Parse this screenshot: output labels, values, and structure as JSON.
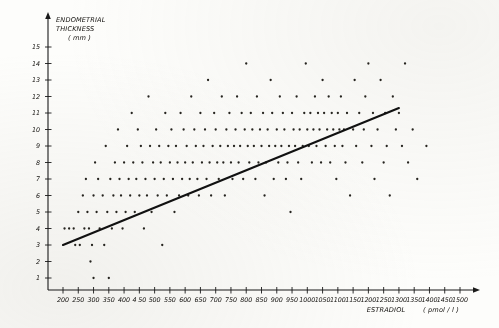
{
  "chart_data": {
    "type": "scatter",
    "title": "",
    "xlabel": "ESTRADIOL",
    "xunit": "( pmol / l )",
    "ylabel_line1": "ENDOMETRIAL",
    "ylabel_line2": "THICKNESS",
    "yunit": "( mm )",
    "xlim": [
      175,
      1520
    ],
    "ylim": [
      0.4,
      15.8
    ],
    "grid": false,
    "legend": "none",
    "xticks": [
      200,
      250,
      300,
      350,
      400,
      450,
      500,
      550,
      600,
      650,
      700,
      750,
      800,
      850,
      900,
      950,
      1000,
      1050,
      1100,
      1150,
      1200,
      1250,
      1300,
      1350,
      1400,
      1450,
      1500
    ],
    "xtick_labels": [
      "200",
      "250",
      "300",
      "350",
      "400",
      "4 50",
      "500",
      "550",
      "600",
      "650",
      "700",
      "750",
      "800",
      "850",
      "900",
      "950",
      "1000",
      "1050",
      "1100",
      "1150",
      "1200",
      "1250",
      "1300",
      "1350",
      "1400",
      "1450",
      "1500"
    ],
    "yticks": [
      1,
      2,
      3,
      4,
      5,
      6,
      7,
      8,
      9,
      10,
      11,
      12,
      13,
      14,
      15
    ],
    "ytick_labels": [
      "1",
      "2",
      "3",
      "4",
      "5",
      "6",
      "7",
      "8",
      "9",
      "10",
      "11",
      "12",
      "13",
      "14",
      "15"
    ],
    "regression_line": {
      "x_start": 200,
      "y_start": 3.0,
      "x_end": 1300,
      "y_end": 11.3,
      "slope_per_1000": 7.55,
      "intercept": 1.49
    },
    "point_color": "#26241f",
    "line_color": "#111111",
    "points": [
      [
        205,
        4
      ],
      [
        220,
        4
      ],
      [
        235,
        4
      ],
      [
        240,
        3
      ],
      [
        250,
        5
      ],
      [
        255,
        3
      ],
      [
        265,
        6
      ],
      [
        270,
        4
      ],
      [
        275,
        7
      ],
      [
        280,
        5
      ],
      [
        285,
        4
      ],
      [
        290,
        2
      ],
      [
        295,
        3
      ],
      [
        300,
        6
      ],
      [
        300,
        1
      ],
      [
        305,
        8
      ],
      [
        310,
        5
      ],
      [
        315,
        7
      ],
      [
        320,
        4
      ],
      [
        330,
        6
      ],
      [
        335,
        3
      ],
      [
        340,
        9
      ],
      [
        345,
        5
      ],
      [
        350,
        1
      ],
      [
        355,
        7
      ],
      [
        360,
        4
      ],
      [
        365,
        6
      ],
      [
        370,
        8
      ],
      [
        375,
        5
      ],
      [
        380,
        10
      ],
      [
        385,
        7
      ],
      [
        390,
        6
      ],
      [
        395,
        4
      ],
      [
        400,
        8
      ],
      [
        405,
        5
      ],
      [
        410,
        9
      ],
      [
        415,
        7
      ],
      [
        420,
        6
      ],
      [
        425,
        11
      ],
      [
        430,
        8
      ],
      [
        435,
        5
      ],
      [
        440,
        7
      ],
      [
        445,
        10
      ],
      [
        450,
        6
      ],
      [
        455,
        9
      ],
      [
        460,
        8
      ],
      [
        465,
        4
      ],
      [
        470,
        7
      ],
      [
        475,
        6
      ],
      [
        480,
        12
      ],
      [
        485,
        9
      ],
      [
        490,
        5
      ],
      [
        495,
        8
      ],
      [
        500,
        7
      ],
      [
        505,
        10
      ],
      [
        510,
        6
      ],
      [
        515,
        9
      ],
      [
        520,
        8
      ],
      [
        525,
        3
      ],
      [
        530,
        7
      ],
      [
        535,
        11
      ],
      [
        540,
        6
      ],
      [
        545,
        9
      ],
      [
        550,
        8
      ],
      [
        555,
        10
      ],
      [
        560,
        7
      ],
      [
        565,
        5
      ],
      [
        570,
        9
      ],
      [
        575,
        8
      ],
      [
        580,
        6
      ],
      [
        585,
        11
      ],
      [
        590,
        7
      ],
      [
        595,
        10
      ],
      [
        600,
        8
      ],
      [
        605,
        9
      ],
      [
        610,
        6
      ],
      [
        615,
        7
      ],
      [
        620,
        12
      ],
      [
        625,
        8
      ],
      [
        630,
        10
      ],
      [
        635,
        9
      ],
      [
        640,
        7
      ],
      [
        645,
        6
      ],
      [
        650,
        11
      ],
      [
        655,
        8
      ],
      [
        660,
        9
      ],
      [
        665,
        10
      ],
      [
        670,
        7
      ],
      [
        675,
        13
      ],
      [
        680,
        8
      ],
      [
        685,
        6
      ],
      [
        690,
        9
      ],
      [
        695,
        11
      ],
      [
        700,
        10
      ],
      [
        705,
        8
      ],
      [
        710,
        7
      ],
      [
        715,
        9
      ],
      [
        720,
        12
      ],
      [
        725,
        8
      ],
      [
        730,
        6
      ],
      [
        735,
        10
      ],
      [
        740,
        9
      ],
      [
        745,
        11
      ],
      [
        750,
        8
      ],
      [
        755,
        7
      ],
      [
        760,
        9
      ],
      [
        765,
        10
      ],
      [
        770,
        12
      ],
      [
        775,
        8
      ],
      [
        780,
        9
      ],
      [
        785,
        11
      ],
      [
        790,
        7
      ],
      [
        795,
        10
      ],
      [
        800,
        14
      ],
      [
        805,
        9
      ],
      [
        810,
        8
      ],
      [
        815,
        11
      ],
      [
        820,
        10
      ],
      [
        825,
        9
      ],
      [
        830,
        7
      ],
      [
        835,
        12
      ],
      [
        840,
        8
      ],
      [
        845,
        10
      ],
      [
        850,
        9
      ],
      [
        855,
        11
      ],
      [
        860,
        6
      ],
      [
        865,
        8
      ],
      [
        870,
        10
      ],
      [
        875,
        9
      ],
      [
        880,
        13
      ],
      [
        885,
        11
      ],
      [
        890,
        7
      ],
      [
        895,
        9
      ],
      [
        900,
        10
      ],
      [
        905,
        8
      ],
      [
        910,
        12
      ],
      [
        915,
        9
      ],
      [
        920,
        11
      ],
      [
        925,
        10
      ],
      [
        930,
        7
      ],
      [
        935,
        8
      ],
      [
        940,
        9
      ],
      [
        945,
        5
      ],
      [
        950,
        11
      ],
      [
        955,
        10
      ],
      [
        960,
        9
      ],
      [
        965,
        12
      ],
      [
        970,
        8
      ],
      [
        975,
        10
      ],
      [
        980,
        7
      ],
      [
        985,
        9
      ],
      [
        990,
        11
      ],
      [
        995,
        14
      ],
      [
        1000,
        10
      ],
      [
        1005,
        9
      ],
      [
        1010,
        11
      ],
      [
        1015,
        8
      ],
      [
        1020,
        10
      ],
      [
        1025,
        12
      ],
      [
        1030,
        9
      ],
      [
        1035,
        11
      ],
      [
        1040,
        10
      ],
      [
        1045,
        8
      ],
      [
        1050,
        13
      ],
      [
        1055,
        11
      ],
      [
        1060,
        9
      ],
      [
        1065,
        10
      ],
      [
        1070,
        12
      ],
      [
        1075,
        8
      ],
      [
        1080,
        11
      ],
      [
        1085,
        10
      ],
      [
        1090,
        9
      ],
      [
        1095,
        7
      ],
      [
        1100,
        11
      ],
      [
        1105,
        10
      ],
      [
        1110,
        12
      ],
      [
        1115,
        9
      ],
      [
        1120,
        10
      ],
      [
        1125,
        8
      ],
      [
        1130,
        11
      ],
      [
        1140,
        6
      ],
      [
        1150,
        10
      ],
      [
        1155,
        13
      ],
      [
        1160,
        9
      ],
      [
        1170,
        11
      ],
      [
        1180,
        8
      ],
      [
        1185,
        10
      ],
      [
        1190,
        12
      ],
      [
        1200,
        14
      ],
      [
        1210,
        9
      ],
      [
        1215,
        11
      ],
      [
        1220,
        7
      ],
      [
        1230,
        10
      ],
      [
        1240,
        13
      ],
      [
        1250,
        8
      ],
      [
        1255,
        11
      ],
      [
        1260,
        9
      ],
      [
        1270,
        6
      ],
      [
        1280,
        12
      ],
      [
        1290,
        10
      ],
      [
        1300,
        11
      ],
      [
        1310,
        9
      ],
      [
        1320,
        14
      ],
      [
        1330,
        8
      ],
      [
        1345,
        10
      ],
      [
        1360,
        7
      ],
      [
        1390,
        9
      ]
    ]
  }
}
